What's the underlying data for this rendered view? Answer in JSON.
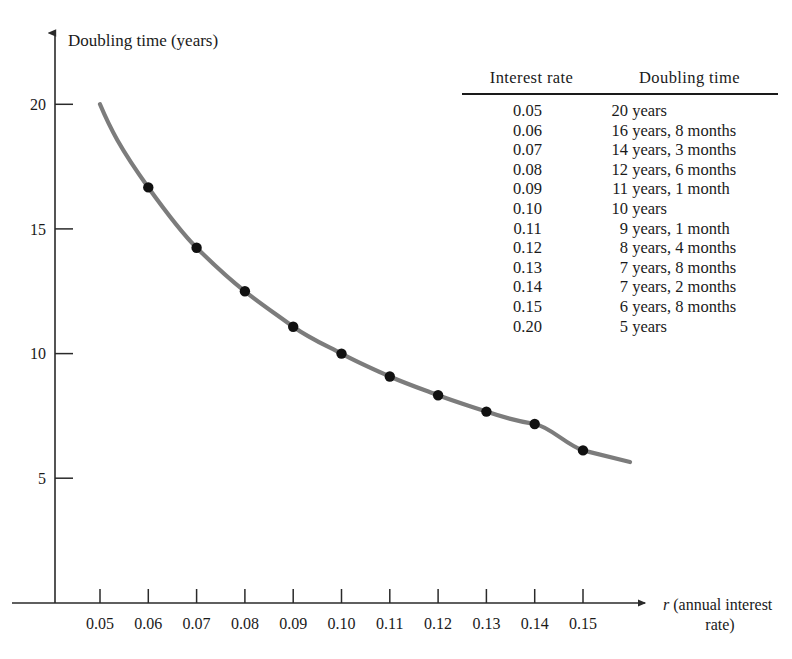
{
  "chart_data": {
    "type": "line",
    "title": "",
    "ylabel": "Doubling time (years)",
    "xlabel_var": "r",
    "xlabel_rest_line1": "(annual interest",
    "xlabel_rest_line2": "rate)",
    "xlim": [
      0.045,
      0.158
    ],
    "ylim": [
      0,
      22.5
    ],
    "xticks": [
      "0.05",
      "0.06",
      "0.07",
      "0.08",
      "0.09",
      "0.10",
      "0.11",
      "0.12",
      "0.13",
      "0.14",
      "0.15"
    ],
    "xtick_values": [
      0.05,
      0.06,
      0.07,
      0.08,
      0.09,
      0.1,
      0.11,
      0.12,
      0.13,
      0.14,
      0.15
    ],
    "yticks": [
      "20",
      "15",
      "10",
      "5"
    ],
    "ytick_values": [
      20,
      15,
      10,
      5
    ],
    "grid": false,
    "legend": "none",
    "curve_color": "#7c7c7c",
    "marker_color": "#111111",
    "axis_color": "#2a2a2a",
    "x": [
      0.05,
      0.06,
      0.07,
      0.08,
      0.09,
      0.1,
      0.11,
      0.12,
      0.13,
      0.14,
      0.15
    ],
    "y": [
      20.0,
      16.67,
      14.25,
      12.5,
      11.08,
      10.0,
      9.08,
      8.33,
      7.67,
      7.17,
      6.67
    ],
    "markers_x": [
      0.06,
      0.07,
      0.08,
      0.09,
      0.1,
      0.11,
      0.12,
      0.13,
      0.14,
      0.15
    ],
    "markers_y": [
      16.67,
      14.25,
      12.5,
      11.08,
      10.0,
      9.08,
      8.33,
      7.67,
      7.17,
      6.67
    ],
    "curve_extends_to_x": 0.163
  },
  "table": {
    "headers": [
      "Interest rate",
      "Doubling time"
    ],
    "rows": [
      {
        "rate": "0.05",
        "time_num": "20",
        "time_rest": "years"
      },
      {
        "rate": "0.06",
        "time_num": "16",
        "time_rest": "years, 8 months"
      },
      {
        "rate": "0.07",
        "time_num": "14",
        "time_rest": "years, 3 months"
      },
      {
        "rate": "0.08",
        "time_num": "12",
        "time_rest": "years, 6 months"
      },
      {
        "rate": "0.09",
        "time_num": "11",
        "time_rest": "years, 1 month"
      },
      {
        "rate": "0.10",
        "time_num": "10",
        "time_rest": "years"
      },
      {
        "rate": "0.11",
        "time_num": "9",
        "time_rest": "years, 1 month"
      },
      {
        "rate": "0.12",
        "time_num": "8",
        "time_rest": "years, 4 months"
      },
      {
        "rate": "0.13",
        "time_num": "7",
        "time_rest": "years, 8 months"
      },
      {
        "rate": "0.14",
        "time_num": "7",
        "time_rest": "years, 2 months"
      },
      {
        "rate": "0.15",
        "time_num": "6",
        "time_rest": "years, 8 months"
      },
      {
        "rate": "0.20",
        "time_num": "5",
        "time_rest": "years"
      }
    ]
  }
}
